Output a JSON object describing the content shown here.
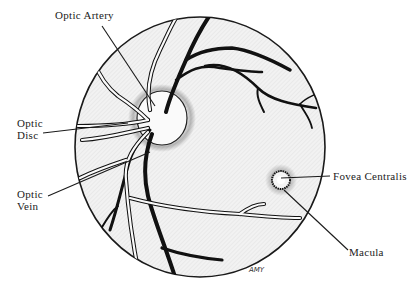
{
  "diagram": {
    "type": "anatomical illustration",
    "colors": {
      "background": "#ffffff",
      "fundus_fill": "#efefef",
      "outline": "#1a1a1a",
      "vessel_dark": "#111111",
      "disc_fill": "#fafafa"
    },
    "labels": {
      "optic_artery": "Optic Artery",
      "optic_disc_line1": "Optic",
      "optic_disc_line2": "Disc",
      "optic_vein_line1": "Optic",
      "optic_vein_line2": "Vein",
      "fovea_centralis": "Fovea Centralis",
      "macula": "Macula"
    },
    "signature": "AMY"
  }
}
